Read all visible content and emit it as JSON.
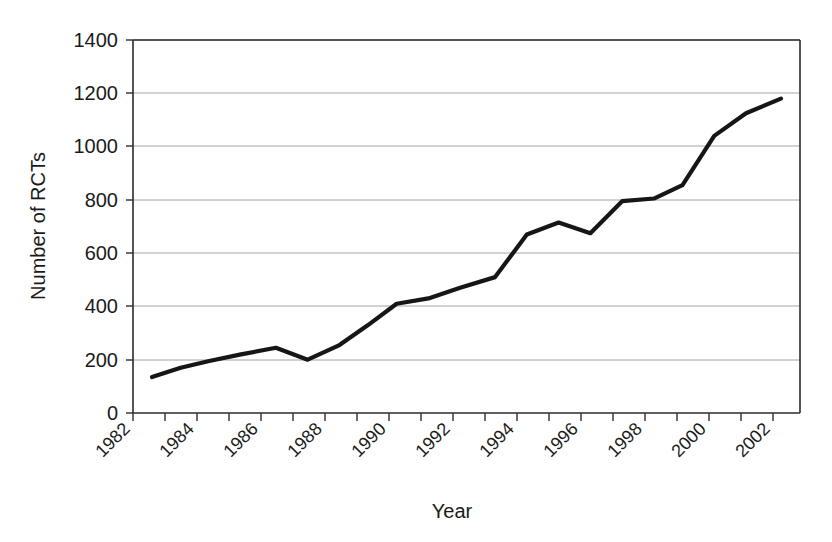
{
  "chart_data": {
    "type": "line",
    "title": "",
    "xlabel": "Year",
    "ylabel": "Number of RCTs",
    "xlim": [
      1982,
      2003
    ],
    "ylim": [
      0,
      1400
    ],
    "grid": true,
    "legend": "none",
    "y_ticks": [
      0,
      200,
      400,
      600,
      800,
      1000,
      1200,
      1400
    ],
    "y_tick_labels": [
      "0",
      "200",
      "400",
      "600",
      "800",
      "1000",
      "1200",
      "1400"
    ],
    "x_ticks": [
      1982,
      1983,
      1984,
      1985,
      1986,
      1987,
      1988,
      1989,
      1990,
      1991,
      1992,
      1993,
      1994,
      1995,
      1996,
      1997,
      1998,
      1999,
      2000,
      2001,
      2002
    ],
    "x_tick_labels": [
      "1982",
      "",
      "1984",
      "",
      "1986",
      "",
      "1988",
      "",
      "1990",
      "",
      "1992",
      "",
      "1994",
      "",
      "1996",
      "",
      "1998",
      "",
      "2000",
      "",
      "2002"
    ],
    "x_tick_labels_shown": [
      "1982",
      "1984",
      "1986",
      "1988",
      "1990",
      "1992",
      "1994",
      "1996",
      "1998",
      "2000",
      "2002"
    ],
    "series": [
      {
        "name": "Number of RCTs",
        "color": "#161616",
        "x": [
          1982.6,
          1983.5,
          1984.4,
          1985.4,
          1986.5,
          1987.5,
          1988.5,
          1989.4,
          1990.3,
          1991.3,
          1992.3,
          1993.4,
          1994.4,
          1995.4,
          1996.4,
          1997.4,
          1998.4,
          1999.3,
          2000.3,
          2001.3,
          2002.4
        ],
        "values": [
          135,
          170,
          195,
          220,
          245,
          200,
          255,
          330,
          410,
          430,
          470,
          510,
          670,
          715,
          675,
          795,
          805,
          855,
          1040,
          1125,
          1180
        ]
      }
    ]
  },
  "axes": {
    "y_axis_title": "Number of RCTs",
    "x_axis_title": "Year"
  }
}
